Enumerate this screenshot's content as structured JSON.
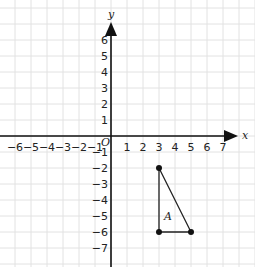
{
  "diagram": {
    "type": "coordinate-grid",
    "origin_px": [
      111,
      136
    ],
    "unit_px": 16,
    "grid_color": "#e2e2e2",
    "axis_color": "#111111",
    "axes": {
      "x_label": "x",
      "y_label": "y",
      "origin_label": "O",
      "x_ticks": [
        -6,
        -5,
        -4,
        -3,
        -2,
        -1,
        1,
        2,
        3,
        4,
        5,
        6,
        7
      ],
      "y_ticks": [
        6,
        5,
        4,
        3,
        2,
        1,
        -1,
        -2,
        -3,
        -4,
        -5,
        -6,
        -7
      ]
    },
    "shape": {
      "label": "A",
      "kind": "triangle",
      "vertices": [
        [
          3,
          -2
        ],
        [
          3,
          -6
        ],
        [
          5,
          -6
        ]
      ]
    }
  }
}
